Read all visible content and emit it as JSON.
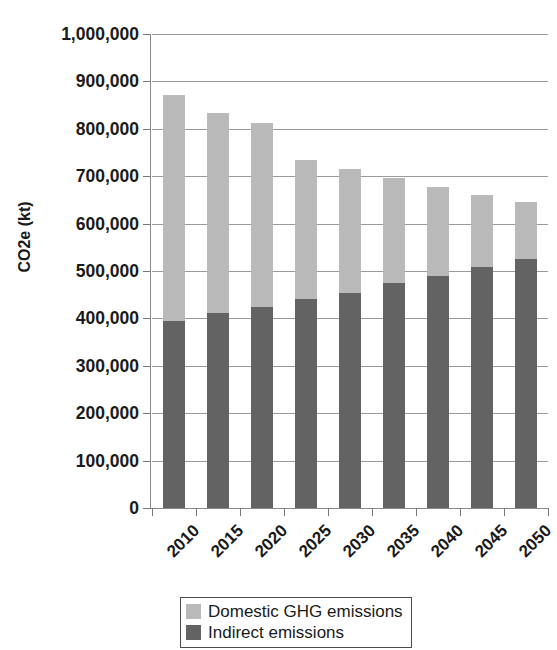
{
  "chart_data": {
    "type": "bar",
    "subtype": "stacked-vertical",
    "title": "",
    "xlabel": "",
    "ylabel": "CO2e (kt)",
    "ylim": [
      0,
      1000000
    ],
    "ytick_step": 100000,
    "grid": true,
    "legend_position": "bottom",
    "categories": [
      "2010",
      "2015",
      "2020",
      "2025",
      "2030",
      "2035",
      "2040",
      "2045",
      "2050"
    ],
    "ytick_labels": [
      "0",
      "100,000",
      "200,000",
      "300,000",
      "400,000",
      "500,000",
      "600,000",
      "700,000",
      "800,000",
      "900,000",
      "1,000,000"
    ],
    "ytick_values": [
      0,
      100000,
      200000,
      300000,
      400000,
      500000,
      600000,
      700000,
      800000,
      900000,
      1000000
    ],
    "series": [
      {
        "name": "Indirect emissions",
        "color": "#636363",
        "values": [
          395000,
          412000,
          424000,
          440000,
          454000,
          474000,
          490000,
          508000,
          526000
        ]
      },
      {
        "name": "Domestic GHG emissions",
        "color": "#b9b9b9",
        "values": [
          477000,
          422000,
          388000,
          295000,
          262000,
          222000,
          188000,
          153000,
          119000
        ]
      }
    ],
    "totals": [
      872000,
      834000,
      812000,
      735000,
      716000,
      696000,
      678000,
      661000,
      645000
    ]
  },
  "legend": {
    "items": [
      {
        "label": "Domestic GHG emissions",
        "color": "#b9b9b9"
      },
      {
        "label": "Indirect emissions",
        "color": "#636363"
      }
    ]
  }
}
